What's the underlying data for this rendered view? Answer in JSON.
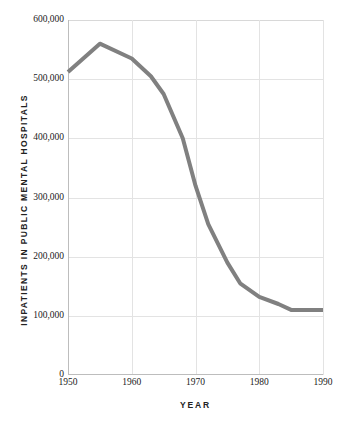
{
  "chart_data": {
    "type": "line",
    "title": "",
    "xlabel": "YEAR",
    "ylabel": "INPATIENTS IN PUBLIC MENTAL HOSPITALS",
    "xlim": [
      1950,
      1990
    ],
    "ylim": [
      0,
      600000
    ],
    "grid": true,
    "legend": "none",
    "line_color": "#808080",
    "line_width_px": 4,
    "x_ticks": [
      1950,
      1960,
      1970,
      1980,
      1990
    ],
    "x_tick_labels": [
      "1950",
      "1960",
      "1970",
      "1980",
      "1990"
    ],
    "y_ticks": [
      0,
      100000,
      200000,
      300000,
      400000,
      500000,
      600000
    ],
    "y_tick_labels": [
      "0",
      "100,000",
      "200,000",
      "300,000",
      "400,000",
      "500,000",
      "600,000"
    ],
    "series": [
      {
        "name": "Inpatients in public mental hospitals",
        "x": [
          1950,
          1955,
          1960,
          1963,
          1965,
          1968,
          1970,
          1972,
          1975,
          1977,
          1980,
          1983,
          1985,
          1990
        ],
        "values": [
          512000,
          560000,
          535000,
          505000,
          475000,
          400000,
          320000,
          255000,
          190000,
          155000,
          132000,
          120000,
          110000,
          110000
        ]
      }
    ],
    "annotations": []
  },
  "axes": {
    "y_title": "INPATIENTS IN PUBLIC MENTAL HOSPITALS",
    "x_title": "YEAR"
  },
  "colors": {
    "series_gray": "#808080",
    "gridline": "#e3e3e3",
    "axis": "#bdbdbd",
    "text": "#1a1a1a",
    "background": "#ffffff"
  }
}
